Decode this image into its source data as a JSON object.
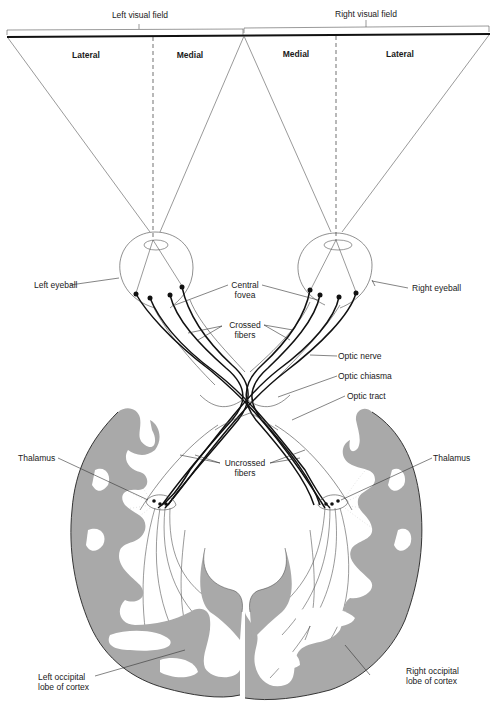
{
  "figure": {
    "visual_fields": {
      "left": "Left visual field",
      "right": "Right visual field"
    },
    "field_regions": {
      "left_lateral": "Lateral",
      "left_medial": "Medial",
      "right_medial": "Medial",
      "right_lateral": "Lateral"
    },
    "labels": {
      "left_eyeball": "Left eyeball",
      "right_eyeball": "Right eyeball",
      "central_fovea_1": "Central",
      "central_fovea_2": "fovea",
      "crossed_fibers_1": "Crossed",
      "crossed_fibers_2": "fibers",
      "optic_nerve": "Optic nerve",
      "optic_chiasma": "Optic chiasma",
      "optic_tract": "Optic tract",
      "thalamus_left": "Thalamus",
      "thalamus_right": "Thalamus",
      "uncrossed_fibers_1": "Uncrossed",
      "uncrossed_fibers_2": "fibers",
      "left_occipital_1": "Left occipital",
      "left_occipital_2": "lobe of cortex",
      "right_occipital_1": "Right occipital",
      "right_occipital_2": "lobe of cortex"
    },
    "colors": {
      "cortex_gray": "#a9a9a9",
      "line": "#111111",
      "background": "#ffffff"
    }
  }
}
